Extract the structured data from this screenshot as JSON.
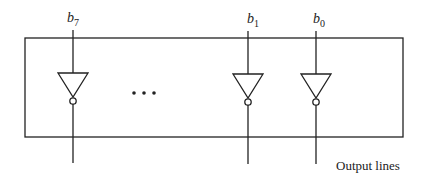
{
  "diagram": {
    "type": "inverter-array",
    "inputs": [
      {
        "base": "b",
        "sub": "7",
        "x": 73
      },
      {
        "base": "b",
        "sub": "1",
        "x": 248
      },
      {
        "base": "b",
        "sub": "0",
        "x": 316
      }
    ],
    "ellipsis": "•••",
    "caption": "Output lines",
    "colors": {
      "stroke": "#222222",
      "background": "#ffffff"
    }
  }
}
